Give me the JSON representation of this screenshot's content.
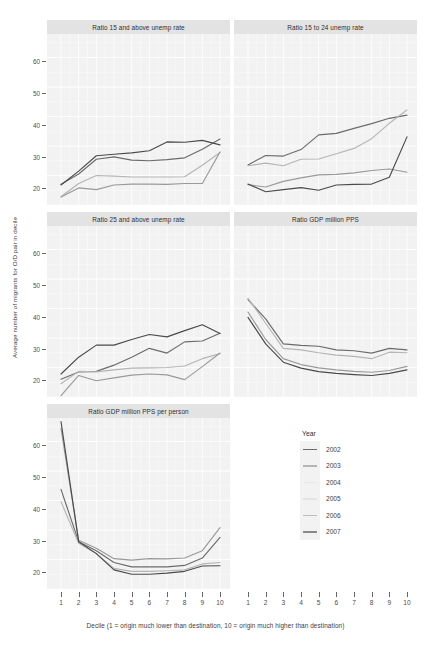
{
  "chart_data": {
    "type": "line",
    "title": "",
    "xlabel": "Decile (1 = origin much lower than destination, 10 = origin much higher than destination)",
    "ylabel": "Average number of migrants for O/D pair in decile",
    "x": [
      1,
      2,
      3,
      4,
      5,
      6,
      7,
      8,
      9,
      10
    ],
    "xlim": [
      1,
      10
    ],
    "ylim": [
      10,
      68
    ],
    "yticks": [
      20,
      30,
      40,
      50,
      60
    ],
    "grid": true,
    "legend_position": "right",
    "legend_title": "Year",
    "legend_entries": [
      "2002",
      "2003",
      "2004",
      "2005",
      "2006",
      "2007"
    ],
    "series_colors": {
      "2002": "#6b6b6b",
      "2003": "#b5b5b5",
      "2004": "#d6d6d6",
      "2005": "#cfcfcf",
      "2006": "#9a9a9a",
      "2007": "#4a4a4a"
    },
    "panels": [
      {
        "title": "Ratio 15 and above unemp rate",
        "series": [
          {
            "name": "2002",
            "values": [
              17.0,
              20.5,
              25.5,
              26.3,
              25.2,
              25.0,
              25.4,
              26.0,
              28.9,
              32.4
            ]
          },
          {
            "name": "2003",
            "values": [
              12.8,
              17.3,
              20.0,
              19.8,
              19.5,
              19.5,
              19.5,
              19.6,
              23.5,
              27.8
            ]
          },
          {
            "name": "2006",
            "values": [
              12.7,
              15.8,
              15.2,
              16.8,
              17.1,
              17.1,
              17.0,
              17.3,
              17.3,
              28.0
            ]
          },
          {
            "name": "2007",
            "values": [
              16.8,
              21.5,
              26.7,
              27.2,
              27.7,
              28.4,
              31.4,
              31.3,
              31.9,
              30.4
            ]
          }
        ]
      },
      {
        "title": "Ratio 15 to 24 unemp rate",
        "series": [
          {
            "name": "2002",
            "values": [
              23.6,
              26.8,
              26.6,
              28.8,
              33.8,
              34.3,
              36.0,
              37.6,
              39.4,
              40.5
            ]
          },
          {
            "name": "2003",
            "values": [
              23.3,
              24.2,
              23.3,
              25.5,
              25.6,
              27.4,
              29.2,
              32.5,
              37.7,
              42.2
            ]
          },
          {
            "name": "2006",
            "values": [
              16.9,
              16.1,
              18.0,
              19.2,
              20.2,
              20.4,
              20.9,
              21.7,
              22.2,
              21.1
            ]
          },
          {
            "name": "2007",
            "values": [
              17.1,
              14.5,
              15.2,
              15.9,
              15.0,
              16.8,
              17.0,
              17.1,
              19.4,
              33.1
            ]
          }
        ]
      },
      {
        "title": "Ratio 25 and above unemp rate",
        "series": [
          {
            "name": "2002",
            "values": [
              16.0,
              18.5,
              18.7,
              20.8,
              23.5,
              26.5,
              24.9,
              28.7,
              29.0,
              31.6
            ]
          },
          {
            "name": "2003",
            "values": [
              14.5,
              18.7,
              18.5,
              19.2,
              19.8,
              19.9,
              20.0,
              20.5,
              23.0,
              24.7
            ]
          },
          {
            "name": "2006",
            "values": [
              10.5,
              17.3,
              15.5,
              16.5,
              17.4,
              17.8,
              17.5,
              15.9,
              20.3,
              24.9
            ]
          },
          {
            "name": "2007",
            "values": [
              17.8,
              23.5,
              27.6,
              27.6,
              29.5,
              31.2,
              30.4,
              32.5,
              34.5,
              31.5
            ]
          }
        ]
      },
      {
        "title": "Ratio GDP million PPS",
        "series": [
          {
            "name": "2002",
            "values": [
              43.0,
              36.5,
              28.0,
              27.5,
              27.2,
              26.0,
              25.7,
              24.9,
              26.5,
              26.0
            ]
          },
          {
            "name": "2003",
            "values": [
              43.5,
              35.0,
              26.5,
              26.0,
              25.0,
              24.2,
              23.8,
              23.0,
              25.2,
              25.0
            ]
          },
          {
            "name": "2006",
            "values": [
              38.8,
              29.5,
              23.0,
              21.0,
              19.9,
              19.2,
              18.7,
              18.4,
              19.0,
              20.4
            ]
          },
          {
            "name": "2007",
            "values": [
              37.0,
              28.0,
              21.8,
              19.8,
              18.6,
              18.0,
              17.6,
              17.3,
              18.0,
              19.2
            ]
          }
        ]
      },
      {
        "title": "Ratio GDP million PPS per person",
        "series": [
          {
            "name": "2002",
            "values": [
              43.8,
              26.0,
              23.0,
              19.0,
              17.5,
              17.5,
              17.5,
              18.0,
              20.5,
              27.5
            ]
          },
          {
            "name": "2003",
            "values": [
              39.6,
              25.5,
              22.0,
              17.0,
              16.0,
              16.0,
              16.2,
              16.5,
              18.5,
              19.0
            ]
          },
          {
            "name": "2006",
            "values": [
              64.5,
              26.5,
              23.8,
              20.3,
              19.8,
              20.3,
              20.2,
              20.5,
              23.0,
              30.8
            ]
          },
          {
            "name": "2007",
            "values": [
              66.8,
              26.0,
              22.0,
              16.5,
              15.0,
              15.0,
              15.4,
              16.0,
              17.8,
              17.9
            ]
          }
        ]
      }
    ]
  },
  "axis": {
    "ytick_labels": [
      "60",
      "50",
      "40",
      "30",
      "20"
    ],
    "xtick_labels": [
      "1",
      "2",
      "3",
      "4",
      "5",
      "6",
      "7",
      "8",
      "9",
      "10"
    ],
    "y_title": "Average number of migrants for O/D pair in decile",
    "x_title": "Decile (1 = origin much lower than destination, 10 = origin much higher than destination)"
  },
  "panel_titles": {
    "p1": "Ratio 15 and above unemp rate",
    "p2": "Ratio 15 to 24 unemp rate",
    "p3": "Ratio 25 and above unemp rate",
    "p4": "Ratio GDP million PPS",
    "p5": "Ratio GDP million PPS per person"
  },
  "legend": {
    "title": "Year",
    "items": [
      {
        "label": "2002",
        "color": "#6b6b6b"
      },
      {
        "label": "2003",
        "color": "#b5b5b5"
      },
      {
        "label": "2004",
        "color": "#e8e8e8"
      },
      {
        "label": "2005",
        "color": "#e4e4e4"
      },
      {
        "label": "2006",
        "color": "#bdbdbd"
      },
      {
        "label": "2007",
        "color": "#8a8a8a"
      }
    ]
  }
}
